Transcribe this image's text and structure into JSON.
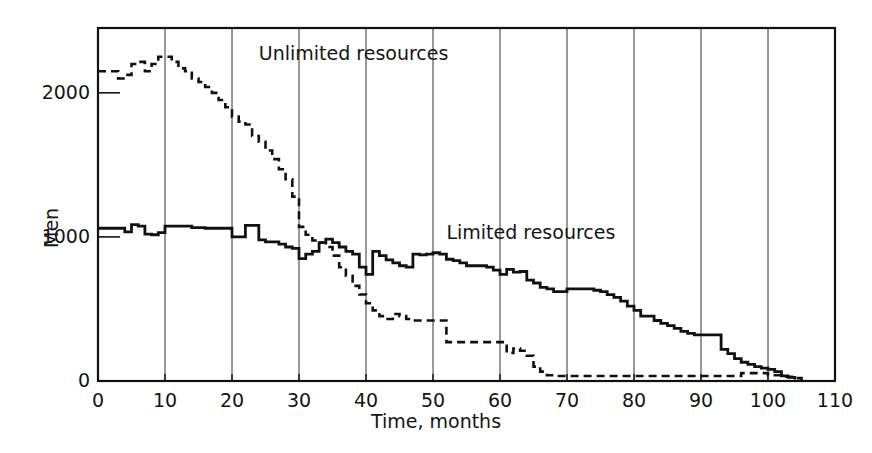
{
  "chart_data": {
    "type": "line",
    "title": "",
    "xlabel": "Time, months",
    "ylabel": "Men",
    "xlim": [
      0,
      110
    ],
    "ylim": [
      0,
      2450
    ],
    "xticks": [
      0,
      10,
      20,
      30,
      40,
      50,
      60,
      70,
      80,
      90,
      100,
      110
    ],
    "xtick_labels": [
      "0",
      "10",
      "20",
      "30",
      "40",
      "50",
      "60",
      "70",
      "80",
      "90",
      "100",
      "110"
    ],
    "yticks": [
      0,
      1000,
      2000
    ],
    "ytick_labels": [
      "0",
      "1000",
      "2000"
    ],
    "grid": "vertical",
    "grid_color": "#333333",
    "axis_color": "#111111",
    "background": "#ffffff",
    "interpolation": "step",
    "series": [
      {
        "name": "Unlimited resources",
        "style": "dashed",
        "color": "#111111",
        "label_x": 24,
        "label_y": 2270,
        "x": [
          0,
          2,
          3,
          4,
          5,
          6,
          7,
          8,
          9,
          10,
          11,
          12,
          13,
          14,
          15,
          16,
          17,
          18,
          19,
          20,
          21,
          22,
          23,
          24,
          25,
          26,
          27,
          28,
          29,
          30,
          31,
          32,
          33,
          34,
          35,
          36,
          37,
          38,
          39,
          40,
          41,
          42,
          43,
          44,
          45,
          46,
          47,
          48,
          49,
          50,
          51,
          52,
          53,
          56,
          60,
          61,
          62,
          63,
          64,
          65,
          66,
          67,
          68,
          70,
          80,
          90,
          96,
          100,
          102,
          104,
          105
        ],
        "y": [
          2150,
          2150,
          2100,
          2125,
          2200,
          2215,
          2150,
          2200,
          2250,
          2250,
          2215,
          2170,
          2150,
          2100,
          2075,
          2040,
          2000,
          1950,
          1900,
          1835,
          1800,
          1780,
          1700,
          1660,
          1600,
          1540,
          1470,
          1400,
          1280,
          1070,
          1015,
          975,
          960,
          930,
          870,
          790,
          730,
          660,
          600,
          540,
          490,
          450,
          430,
          465,
          450,
          430,
          420,
          420,
          420,
          420,
          420,
          270,
          270,
          270,
          270,
          195,
          225,
          210,
          175,
          100,
          65,
          40,
          35,
          35,
          35,
          35,
          55,
          40,
          30,
          20,
          0
        ]
      },
      {
        "name": "Limited resources",
        "style": "solid",
        "color": "#111111",
        "label_x": 52,
        "label_y": 1030,
        "x": [
          0,
          3,
          4,
          5,
          6,
          7,
          8,
          9,
          10,
          11,
          14,
          16,
          19,
          20,
          21,
          22,
          23,
          24,
          25,
          26,
          27,
          28,
          29,
          30,
          31,
          32,
          33,
          34,
          35,
          36,
          37,
          38,
          39,
          40,
          41,
          42,
          43,
          44,
          45,
          46,
          47,
          48,
          49,
          50,
          51,
          52,
          53,
          54,
          55,
          56,
          57,
          58,
          59,
          60,
          61,
          62,
          63,
          64,
          65,
          66,
          67,
          68,
          69,
          70,
          71,
          72,
          73,
          74,
          75,
          76,
          77,
          78,
          79,
          80,
          81,
          82,
          83,
          84,
          85,
          86,
          87,
          88,
          89,
          90,
          91,
          92,
          93,
          94,
          95,
          96,
          97,
          98,
          99,
          100,
          101,
          102,
          103,
          104
        ],
        "y": [
          1060,
          1060,
          1035,
          1085,
          1075,
          1020,
          1015,
          1030,
          1075,
          1075,
          1065,
          1060,
          1060,
          1000,
          1000,
          1080,
          1080,
          980,
          965,
          965,
          950,
          930,
          920,
          850,
          880,
          900,
          960,
          985,
          960,
          930,
          900,
          880,
          790,
          740,
          900,
          870,
          840,
          820,
          800,
          790,
          880,
          875,
          880,
          890,
          880,
          845,
          835,
          820,
          800,
          800,
          800,
          790,
          770,
          740,
          775,
          755,
          760,
          700,
          680,
          650,
          640,
          620,
          620,
          640,
          640,
          640,
          640,
          630,
          620,
          600,
          580,
          555,
          520,
          490,
          450,
          450,
          420,
          400,
          385,
          365,
          345,
          330,
          320,
          320,
          320,
          320,
          220,
          190,
          155,
          130,
          115,
          100,
          90,
          80,
          65,
          35,
          25,
          10
        ]
      }
    ]
  },
  "axis": {
    "y_title": "Men",
    "x_title": "Time, months"
  },
  "labels": {
    "series_unlimited": "Unlimited resources",
    "series_limited": "Limited resources"
  }
}
